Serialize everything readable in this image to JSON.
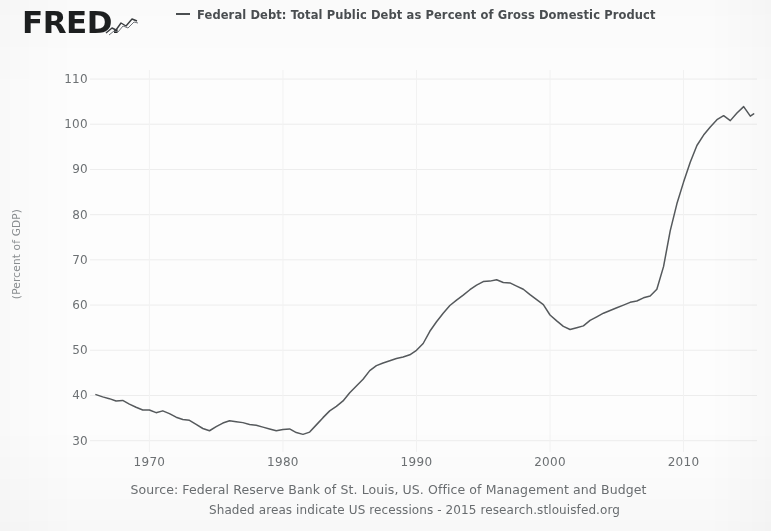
{
  "brand": {
    "logo_text": "FRED",
    "logo_dot": ".",
    "spark_icon": "sparkline-icon"
  },
  "legend": {
    "swatch_icon": "line-swatch-icon",
    "label": "Federal Debt: Total Public Debt as Percent of Gross Domestic Product",
    "color": "#4b4f52"
  },
  "footer": {
    "source": "Source: Federal Reserve Bank of St. Louis, US. Office of Management and Budget",
    "note": "Shaded areas indicate US recessions - 2015 research.stlouisfed.org"
  },
  "chart_data": {
    "type": "line",
    "title": "",
    "subtitle": "",
    "xlabel": "",
    "ylabel": "(Percent of GDP)",
    "legend_position": "top",
    "grid": true,
    "line_color": "#55595c",
    "background": "#fdfdfd",
    "xlim": [
      1966,
      2015.5
    ],
    "ylim": [
      27.5,
      112
    ],
    "xticks": [
      1970,
      1980,
      1990,
      2000,
      2010
    ],
    "xtick_labels": [
      "1970",
      "1980",
      "1990",
      "2000",
      "2010"
    ],
    "yticks": [
      30,
      40,
      50,
      60,
      70,
      80,
      90,
      100,
      110
    ],
    "ytick_labels": [
      "30",
      "40",
      "50",
      "60",
      "70",
      "80",
      "90",
      "100",
      "110"
    ],
    "series": [
      {
        "name": "Federal Debt: Total Public Debt as Percent of Gross Domestic Product",
        "units": "Percent of GDP",
        "x": [
          1966.0,
          1966.5,
          1967.0,
          1967.5,
          1968.0,
          1968.5,
          1969.0,
          1969.5,
          1970.0,
          1970.5,
          1971.0,
          1971.5,
          1972.0,
          1972.5,
          1973.0,
          1973.5,
          1974.0,
          1974.5,
          1975.0,
          1975.5,
          1976.0,
          1976.5,
          1977.0,
          1977.5,
          1978.0,
          1978.5,
          1979.0,
          1979.5,
          1980.0,
          1980.5,
          1981.0,
          1981.5,
          1982.0,
          1982.5,
          1983.0,
          1983.5,
          1984.0,
          1984.5,
          1985.0,
          1985.5,
          1986.0,
          1986.5,
          1987.0,
          1987.5,
          1988.0,
          1988.5,
          1989.0,
          1989.5,
          1990.0,
          1990.5,
          1991.0,
          1991.5,
          1992.0,
          1992.5,
          1993.0,
          1993.5,
          1994.0,
          1994.5,
          1995.0,
          1995.5,
          1996.0,
          1996.5,
          1997.0,
          1997.5,
          1998.0,
          1998.5,
          1999.0,
          1999.5,
          2000.0,
          2000.5,
          2001.0,
          2001.5,
          2002.0,
          2002.5,
          2003.0,
          2003.5,
          2004.0,
          2004.5,
          2005.0,
          2005.5,
          2006.0,
          2006.5,
          2007.0,
          2007.5,
          2008.0,
          2008.5,
          2009.0,
          2009.5,
          2010.0,
          2010.5,
          2011.0,
          2011.5,
          2012.0,
          2012.5,
          2013.0,
          2013.5,
          2014.0,
          2014.5,
          2015.0,
          2015.25
        ],
        "y": [
          40.2,
          39.7,
          39.3,
          38.8,
          38.9,
          38.1,
          37.4,
          36.8,
          36.8,
          36.2,
          36.6,
          36.0,
          35.2,
          34.7,
          34.5,
          33.6,
          32.7,
          32.2,
          33.1,
          33.9,
          34.4,
          34.2,
          34.0,
          33.6,
          33.4,
          33.0,
          32.6,
          32.2,
          32.5,
          32.6,
          31.8,
          31.4,
          31.9,
          33.5,
          35.1,
          36.6,
          37.6,
          38.8,
          40.6,
          42.1,
          43.6,
          45.5,
          46.6,
          47.2,
          47.7,
          48.2,
          48.5,
          49.0,
          50.0,
          51.5,
          54.2,
          56.3,
          58.2,
          59.9,
          61.1,
          62.2,
          63.4,
          64.4,
          65.2,
          65.3,
          65.6,
          65.0,
          64.9,
          64.2,
          63.5,
          62.3,
          61.2,
          60.1,
          57.8,
          56.5,
          55.3,
          54.6,
          55.0,
          55.4,
          56.6,
          57.4,
          58.2,
          58.8,
          59.4,
          60.0,
          60.6,
          60.9,
          61.6,
          62.0,
          63.5,
          68.5,
          76.4,
          82.4,
          87.2,
          91.6,
          95.3,
          97.6,
          99.4,
          101.0,
          101.9,
          100.8,
          102.5,
          103.9,
          101.8,
          102.3
        ]
      }
    ]
  }
}
